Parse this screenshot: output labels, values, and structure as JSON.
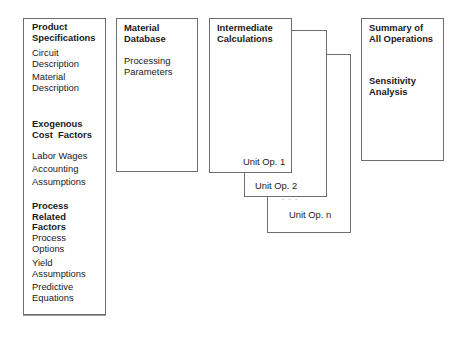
{
  "diagram": {
    "type": "block-flow",
    "boxes": {
      "inputs": {
        "sections": [
          {
            "heading": [
              "Product",
              "Specifications"
            ],
            "items": [
              [
                "Circuit",
                "Description"
              ],
              [
                "Material",
                "Description"
              ]
            ]
          },
          {
            "heading": [
              "Exogenous",
              "Cost  Factors"
            ],
            "items": [
              [
                "Labor Wages"
              ],
              [
                "Accounting",
                "Assumptions"
              ]
            ]
          },
          {
            "heading": [
              "Process",
              "Related",
              "Factors"
            ],
            "items": [
              [
                "Process",
                "Options"
              ],
              [
                "Yield",
                "Assumptions"
              ],
              [
                "Predictive",
                "Equations"
              ]
            ]
          }
        ]
      },
      "database": {
        "heading": [
          "Material",
          "Database"
        ],
        "items": [
          [
            "Processing",
            "Parameters"
          ]
        ]
      },
      "calculations": {
        "heading": [
          "Intermediate",
          "Calculations"
        ],
        "stack": [
          "Unit Op. 1",
          "Unit Op. 2",
          "Unit Op. n"
        ],
        "ellipsis": ". . ."
      },
      "summary": {
        "heading": [
          "Summary of",
          "All Operations"
        ],
        "items": [
          [
            "Sensitivity",
            "Analysis"
          ]
        ]
      }
    }
  }
}
